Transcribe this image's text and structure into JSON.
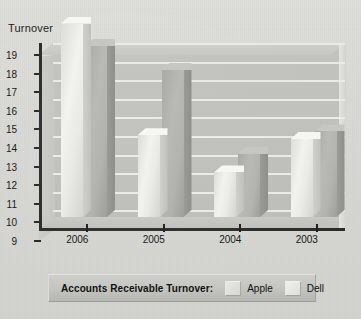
{
  "axis_title": "Turnover",
  "y_ticks": [
    "19",
    "18",
    "17",
    "16",
    "15",
    "14",
    "13",
    "12",
    "11",
    "10",
    "9"
  ],
  "x_labels": [
    "2006",
    "2005",
    "2004",
    "2003"
  ],
  "legend": {
    "title": "Accounts Receivable Turnover:",
    "series": [
      {
        "name": "Apple",
        "swatch_color": "#e0e0dd"
      },
      {
        "name": "Dell",
        "swatch_color": "#ededea"
      }
    ]
  },
  "colors": {
    "background": "#d9d9d6",
    "plot_back_wall": "#bfbfbc",
    "gridline": "#eceae6",
    "axis": "#2a2a2a",
    "apple_bar": "#eaeae7",
    "dell_bar": "#b2b2af"
  },
  "chart_data": {
    "type": "bar",
    "title": "",
    "xlabel": "",
    "ylabel": "Turnover",
    "ylim": [
      9,
      19
    ],
    "ytick_step": 1,
    "grid": true,
    "legend_position": "bottom",
    "three_d": true,
    "categories": [
      "2006",
      "2005",
      "2004",
      "2003"
    ],
    "series": [
      {
        "name": "Apple",
        "values": [
          19.4,
          13.4,
          11.4,
          13.2
        ]
      },
      {
        "name": "Dell",
        "values": [
          18.2,
          16.9,
          12.4,
          13.6
        ]
      }
    ],
    "annotations": []
  }
}
